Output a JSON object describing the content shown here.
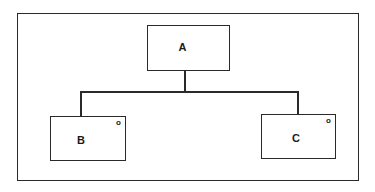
{
  "diagram": {
    "type": "hierarchy",
    "nodes": [
      {
        "id": "A",
        "label": "A",
        "marker": ""
      },
      {
        "id": "B",
        "label": "B",
        "marker": "o"
      },
      {
        "id": "C",
        "label": "C",
        "marker": "o"
      }
    ],
    "edges": [
      {
        "from": "A",
        "to": "B"
      },
      {
        "from": "A",
        "to": "C"
      }
    ],
    "colors": {
      "stroke": "#2a2a2a",
      "background": "#ffffff"
    }
  }
}
